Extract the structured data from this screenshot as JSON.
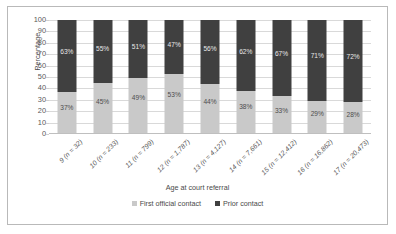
{
  "chart_data": {
    "type": "bar",
    "subtype": "100% stacked column",
    "title": "",
    "xlabel": "Age at court referral",
    "ylabel": "Percentage",
    "ylim": [
      0,
      100
    ],
    "ytick_step": 10,
    "ytick_labels": [
      "100",
      "90",
      "80",
      "70",
      "60",
      "50",
      "40",
      "30",
      "20",
      "10",
      "0"
    ],
    "grid": true,
    "grid_orientation": "horizontal",
    "legend_position": "bottom-center",
    "categories": [
      "9 (n = 32)",
      "10 (n = 233)",
      "11 (n = 799)",
      "12 (n = 1,787)",
      "13 (n = 4,127)",
      "14 (n = 7,661)",
      "15 (n = 12,412)",
      "16 (n = 16,862)",
      "17 (n = 20,473)"
    ],
    "series": [
      {
        "name": "First official contact",
        "color": "#c9c9c9",
        "values": [
          37,
          45,
          49,
          53,
          44,
          38,
          33,
          29,
          28
        ],
        "labels": [
          "37%",
          "45%",
          "49%",
          "53%",
          "44%",
          "38%",
          "33%",
          "29%",
          "28%"
        ]
      },
      {
        "name": "Prior contact",
        "color": "#404040",
        "values": [
          63,
          55,
          51,
          47,
          56,
          62,
          67,
          71,
          72
        ],
        "labels": [
          "63%",
          "55%",
          "51%",
          "47%",
          "56%",
          "62%",
          "67%",
          "71%",
          "72%"
        ]
      }
    ]
  },
  "legend": {
    "items": [
      {
        "label": "First official contact",
        "color": "#c9c9c9"
      },
      {
        "label": "Prior contact",
        "color": "#404040"
      }
    ]
  }
}
